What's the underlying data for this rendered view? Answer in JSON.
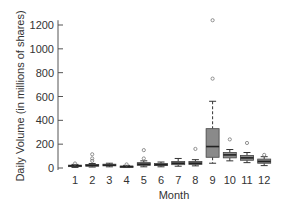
{
  "chart_data": {
    "type": "box",
    "title": "",
    "xlabel": "Month",
    "ylabel": "Daily Volume (in millions of shares)",
    "ylim": [
      0,
      1250
    ],
    "yticks": [
      0,
      200,
      400,
      600,
      800,
      1000,
      1200
    ],
    "ytick_labels": [
      "0",
      "200",
      "400",
      "600",
      "800",
      "1000",
      "1200"
    ],
    "categories": [
      "1",
      "2",
      "3",
      "4",
      "5",
      "6",
      "7",
      "8",
      "9",
      "10",
      "11",
      "12"
    ],
    "grid": false,
    "legend": null,
    "box_color": "#8a8a8a",
    "boxes": [
      {
        "month": "1",
        "whisker_low": 5,
        "q1": 12,
        "median": 18,
        "q3": 24,
        "whisker_high": 30,
        "outliers": [
          38
        ]
      },
      {
        "month": "2",
        "whisker_low": 8,
        "q1": 15,
        "median": 22,
        "q3": 30,
        "whisker_high": 38,
        "outliers": [
          60,
          80,
          115
        ]
      },
      {
        "month": "3",
        "whisker_low": 10,
        "q1": 18,
        "median": 24,
        "q3": 32,
        "whisker_high": 40,
        "outliers": []
      },
      {
        "month": "4",
        "whisker_low": 4,
        "q1": 8,
        "median": 12,
        "q3": 16,
        "whisker_high": 22,
        "outliers": [
          30
        ]
      },
      {
        "month": "5",
        "whisker_low": 10,
        "q1": 22,
        "median": 32,
        "q3": 45,
        "whisker_high": 60,
        "outliers": [
          80,
          150
        ]
      },
      {
        "month": "6",
        "whisker_low": 10,
        "q1": 20,
        "median": 28,
        "q3": 38,
        "whisker_high": 50,
        "outliers": []
      },
      {
        "month": "7",
        "whisker_low": 15,
        "q1": 28,
        "median": 40,
        "q3": 55,
        "whisker_high": 80,
        "outliers": []
      },
      {
        "month": "8",
        "whisker_low": 18,
        "q1": 30,
        "median": 40,
        "q3": 55,
        "whisker_high": 70,
        "outliers": [
          160
        ]
      },
      {
        "month": "9",
        "whisker_low": 40,
        "q1": 90,
        "median": 180,
        "q3": 330,
        "whisker_high": 560,
        "outliers": [
          750,
          1240
        ]
      },
      {
        "month": "10",
        "whisker_low": 60,
        "q1": 85,
        "median": 110,
        "q3": 130,
        "whisker_high": 155,
        "outliers": [
          240
        ]
      },
      {
        "month": "11",
        "whisker_low": 45,
        "q1": 65,
        "median": 85,
        "q3": 105,
        "whisker_high": 130,
        "outliers": [
          210
        ]
      },
      {
        "month": "12",
        "whisker_low": 20,
        "q1": 40,
        "median": 55,
        "q3": 75,
        "whisker_high": 95,
        "outliers": [
          110
        ]
      }
    ]
  }
}
